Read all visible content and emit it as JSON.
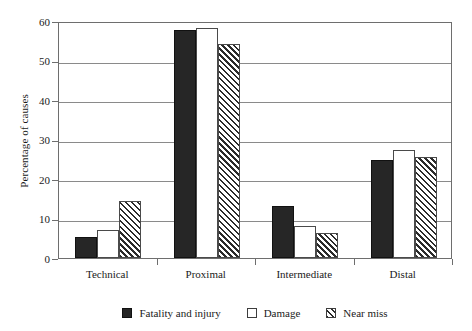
{
  "chart_data": {
    "type": "bar",
    "title": "",
    "subtitle": "",
    "xlabel": "",
    "ylabel": "Percentage of causes",
    "categories": [
      "Technical",
      "Proximal",
      "Intermediate",
      "Distal"
    ],
    "series": [
      {
        "name": "Fatality and injury",
        "style": "solid-black",
        "color": "#262626",
        "values": [
          5.2,
          57.6,
          13.1,
          24.7
        ]
      },
      {
        "name": "Damage",
        "style": "open-white",
        "color": "#ffffff",
        "values": [
          7.0,
          58.2,
          8.0,
          27.3
        ]
      },
      {
        "name": "Near miss",
        "style": "diagonal-hatch",
        "color": "#2b2b2b",
        "values": [
          14.5,
          54.3,
          6.4,
          25.5
        ]
      }
    ],
    "ylim": [
      0,
      60
    ],
    "yticks": [
      0,
      10,
      20,
      30,
      40,
      50,
      60
    ],
    "ytick_labels": [
      "0",
      "10",
      "20",
      "30",
      "40",
      "50",
      "60"
    ],
    "grid": "horizontal",
    "legend_position": "bottom-center",
    "axis_color": "#6e6e6e",
    "grid_color": "#8a8a8a"
  },
  "legend": {
    "items": [
      {
        "label": "Fatality and injury"
      },
      {
        "label": "Damage"
      },
      {
        "label": "Near miss"
      }
    ]
  }
}
